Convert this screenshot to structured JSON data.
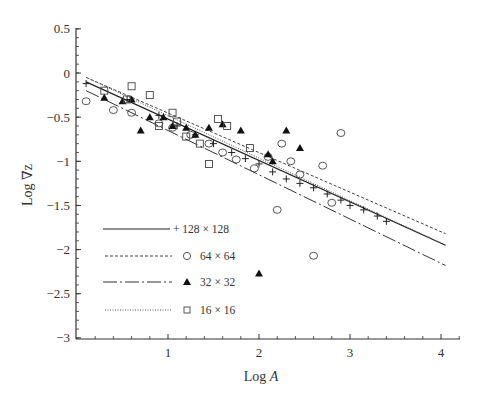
{
  "chart_data": {
    "type": "scatter",
    "title": "",
    "xlabel": "Log A",
    "ylabel": "Log ∇z",
    "xlim": [
      0,
      4.2
    ],
    "ylim": [
      -3,
      0.5
    ],
    "xticks": [
      1,
      2,
      3,
      4
    ],
    "yticks": [
      0.5,
      0,
      -0.5,
      -1,
      -1.5,
      -2,
      -2.5,
      -3
    ],
    "ytick_labels": [
      "0.5",
      "0",
      "−0.5",
      "−1",
      "−1.5",
      "−2",
      "−2.5",
      "−3"
    ],
    "grid": false,
    "legend_position": "lower-left",
    "series": [
      {
        "name": "128 × 128",
        "marker": "plus",
        "line_style": "solid",
        "fit_line": {
          "x": [
            0.1,
            4.05
          ],
          "y": [
            -0.1,
            -1.95
          ]
        },
        "points": [
          [
            0.1,
            -0.12
          ],
          [
            0.55,
            -0.3
          ],
          [
            0.9,
            -0.48
          ],
          [
            1.1,
            -0.6
          ],
          [
            1.3,
            -0.7
          ],
          [
            1.5,
            -0.8
          ],
          [
            1.7,
            -0.9
          ],
          [
            1.85,
            -0.97
          ],
          [
            2.0,
            -1.03
          ],
          [
            2.15,
            -1.12
          ],
          [
            2.3,
            -1.2
          ],
          [
            2.45,
            -1.25
          ],
          [
            2.6,
            -1.3
          ],
          [
            2.75,
            -1.37
          ],
          [
            2.9,
            -1.44
          ],
          [
            3.0,
            -1.5
          ],
          [
            3.15,
            -1.55
          ],
          [
            3.3,
            -1.62
          ],
          [
            3.4,
            -1.68
          ]
        ]
      },
      {
        "name": "64 × 64",
        "marker": "circle",
        "line_style": "dashed",
        "fit_line": {
          "x": [
            0.1,
            4.05
          ],
          "y": [
            -0.05,
            -1.82
          ]
        },
        "points": [
          [
            0.1,
            -0.32
          ],
          [
            0.4,
            -0.42
          ],
          [
            0.6,
            -0.45
          ],
          [
            0.9,
            -0.57
          ],
          [
            1.05,
            -0.62
          ],
          [
            1.25,
            -0.7
          ],
          [
            1.45,
            -0.8
          ],
          [
            1.6,
            -0.9
          ],
          [
            1.75,
            -0.98
          ],
          [
            1.95,
            -1.08
          ],
          [
            2.1,
            -0.95
          ],
          [
            2.2,
            -1.55
          ],
          [
            2.25,
            -0.8
          ],
          [
            2.35,
            -1.0
          ],
          [
            2.45,
            -1.15
          ],
          [
            2.6,
            -2.07
          ],
          [
            2.7,
            -1.05
          ],
          [
            2.8,
            -1.47
          ],
          [
            2.9,
            -0.68
          ]
        ]
      },
      {
        "name": "32 × 32",
        "marker": "triangle-filled",
        "line_style": "long-dash-dot",
        "fit_line": {
          "x": [
            0.1,
            4.05
          ],
          "y": [
            -0.2,
            -2.18
          ]
        },
        "points": [
          [
            0.3,
            -0.28
          ],
          [
            0.5,
            -0.32
          ],
          [
            0.6,
            -0.3
          ],
          [
            0.7,
            -0.65
          ],
          [
            0.8,
            -0.5
          ],
          [
            0.95,
            -0.5
          ],
          [
            1.05,
            -0.6
          ],
          [
            1.2,
            -0.62
          ],
          [
            1.3,
            -0.7
          ],
          [
            1.45,
            -0.62
          ],
          [
            1.6,
            -0.58
          ],
          [
            1.8,
            -0.65
          ],
          [
            2.0,
            -2.27
          ],
          [
            2.1,
            -0.92
          ],
          [
            2.15,
            -1.0
          ],
          [
            2.3,
            -0.65
          ],
          [
            2.45,
            -0.85
          ]
        ]
      },
      {
        "name": "16 × 16",
        "marker": "square",
        "line_style": "dotted",
        "fit_line": {
          "x": [
            0.1,
            4.05
          ],
          "y": [
            -0.05,
            -1.95
          ]
        },
        "points": [
          [
            0.3,
            -0.2
          ],
          [
            0.55,
            -0.3
          ],
          [
            0.6,
            -0.15
          ],
          [
            0.8,
            -0.25
          ],
          [
            0.9,
            -0.6
          ],
          [
            1.05,
            -0.45
          ],
          [
            1.1,
            -0.55
          ],
          [
            1.2,
            -0.72
          ],
          [
            1.35,
            -0.8
          ],
          [
            1.45,
            -1.03
          ],
          [
            1.55,
            -0.52
          ],
          [
            1.65,
            -0.6
          ],
          [
            1.9,
            -0.85
          ]
        ]
      }
    ],
    "legend": [
      {
        "label": "128 × 128",
        "marker": "+",
        "line": "solid"
      },
      {
        "label": "64 × 64",
        "marker": "circle",
        "line": "dashed"
      },
      {
        "label": "32 × 32",
        "marker": "filled triangle",
        "line": "long-dash"
      },
      {
        "label": "16 × 16",
        "marker": "square",
        "line": "dotted"
      }
    ]
  },
  "axes": {
    "xlabel_main": "Log ",
    "xlabel_italic": "A",
    "ylabel": "Log ∇z",
    "x_tick_labels": [
      "1",
      "2",
      "3",
      "4"
    ],
    "y_tick_labels": [
      "0.5",
      "0",
      "−0.5",
      "−1",
      "−1.5",
      "−2",
      "−2.5",
      "−3"
    ]
  },
  "legend": {
    "items": [
      "+ 128 × 128",
      "64 × 64",
      "32 × 32",
      "16 × 16"
    ]
  }
}
